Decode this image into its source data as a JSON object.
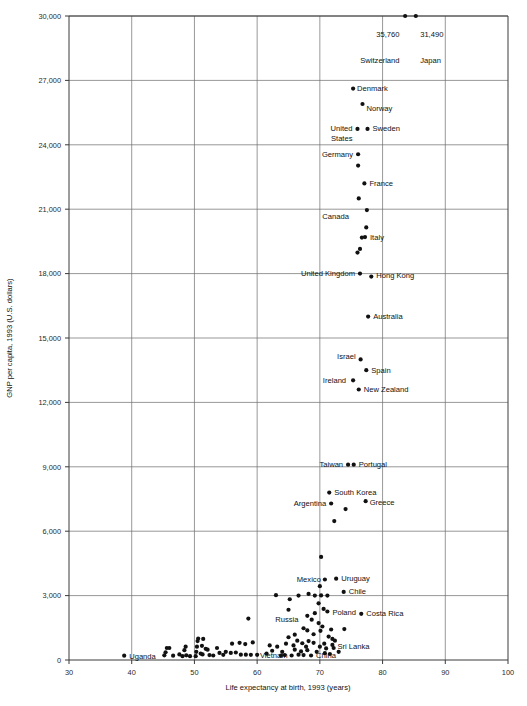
{
  "chart_data": {
    "type": "scatter",
    "title": "",
    "xlabel": "Life expectancy at birth, 1993 (years)",
    "ylabel": "GNP per capita, 1993 (U.S. dollars)",
    "xlim": [
      30,
      100
    ],
    "ylim": [
      0,
      30000
    ],
    "xticks": [
      30,
      40,
      50,
      60,
      70,
      80,
      90,
      100
    ],
    "xtick_labels": [
      "30",
      "40",
      "50",
      "60",
      "70",
      "80",
      "90",
      "100"
    ],
    "yticks": [
      0,
      3000,
      6000,
      9000,
      12000,
      15000,
      18000,
      21000,
      24000,
      27000,
      30000
    ],
    "ytick_labels": [
      "0",
      "3,000",
      "6,000",
      "9,000",
      "12,000",
      "15,000",
      "18,000",
      "21,000",
      "24,000",
      "27,000",
      "30,000"
    ],
    "grid": true,
    "legend": "none",
    "marker_color": "#111111",
    "grid_color": "#6b6b6b",
    "axis_color": "#3a3a3a",
    "annotations": [
      {
        "text": "35,760",
        "x": 83.5,
        "y": 29000,
        "anchor": "end",
        "dx": -5,
        "dy": 0
      },
      {
        "text": "Switzerland",
        "x": 83.5,
        "y": 27800,
        "anchor": "end",
        "dx": -5,
        "dy": 0
      },
      {
        "text": "31,490",
        "x": 85.2,
        "y": 29000,
        "anchor": "start",
        "dx": 5,
        "dy": 0
      },
      {
        "text": "Japan",
        "x": 85.2,
        "y": 27800,
        "anchor": "start",
        "dx": 5,
        "dy": 0
      }
    ],
    "labeled_points": [
      {
        "name": "Switzerland",
        "x": 83.6,
        "y": 30000,
        "label": "",
        "anchor": "end",
        "dx": 0,
        "dy": 0
      },
      {
        "name": "Japan",
        "x": 85.3,
        "y": 30000,
        "label": "",
        "anchor": "start",
        "dx": 0,
        "dy": 0
      },
      {
        "name": "Denmark",
        "x": 75.3,
        "y": 26620,
        "label": "Denmark",
        "anchor": "start",
        "dx": 4,
        "dy": 2.5
      },
      {
        "name": "Norway",
        "x": 76.8,
        "y": 25900,
        "label": "Norway",
        "anchor": "start",
        "dx": 4,
        "dy": 6.5
      },
      {
        "name": "United States",
        "x": 76.0,
        "y": 24740,
        "label": "United\nStates",
        "anchor": "end",
        "dx": -5,
        "dy": 2.5
      },
      {
        "name": "Sweden",
        "x": 77.6,
        "y": 24740,
        "label": "Sweden",
        "anchor": "start",
        "dx": 5,
        "dy": 2.5
      },
      {
        "name": "Germany",
        "x": 76.1,
        "y": 23560,
        "label": "Germany",
        "anchor": "end",
        "dx": -5,
        "dy": 2.5
      },
      {
        "name": "Germany2",
        "x": 76.1,
        "y": 23030,
        "label": "",
        "anchor": "start",
        "dx": 0,
        "dy": 0
      },
      {
        "name": "France",
        "x": 77.1,
        "y": 22200,
        "label": "France",
        "anchor": "start",
        "dx": 5,
        "dy": 2.5
      },
      {
        "name": "Austria",
        "x": 76.2,
        "y": 21500,
        "label": "",
        "anchor": "start",
        "dx": 0,
        "dy": 0
      },
      {
        "name": "Canada",
        "x": 77.5,
        "y": 20960,
        "label": "Canada",
        "anchor": "end",
        "dx": -18,
        "dy": 9
      },
      {
        "name": "Italy",
        "x": 77.4,
        "y": 20150,
        "label": "",
        "anchor": "start",
        "dx": 0,
        "dy": 0
      },
      {
        "name": "ItalyPt",
        "x": 77.2,
        "y": 19700,
        "label": "Italy",
        "anchor": "start",
        "dx": 5,
        "dy": 3
      },
      {
        "name": "Netherlands",
        "x": 76.7,
        "y": 19680,
        "label": "",
        "anchor": "start",
        "dx": 0,
        "dy": 0
      },
      {
        "name": "Belgium",
        "x": 76.4,
        "y": 19150,
        "label": "",
        "anchor": "start",
        "dx": 0,
        "dy": 0
      },
      {
        "name": "Finland",
        "x": 76.0,
        "y": 18980,
        "label": "",
        "anchor": "start",
        "dx": 0,
        "dy": 0
      },
      {
        "name": "United Kingdom",
        "x": 76.4,
        "y": 18000,
        "label": "United Kingdom",
        "anchor": "end",
        "dx": -5,
        "dy": 2.5
      },
      {
        "name": "Hong Kong",
        "x": 78.2,
        "y": 17860,
        "label": "Hong Kong",
        "anchor": "start",
        "dx": 5,
        "dy": 1
      },
      {
        "name": "Australia",
        "x": 77.7,
        "y": 16000,
        "label": "Australia",
        "anchor": "start",
        "dx": 5,
        "dy": 2.5
      },
      {
        "name": "Israel",
        "x": 76.5,
        "y": 14000,
        "label": "Israel",
        "anchor": "end",
        "dx": -5,
        "dy": 0
      },
      {
        "name": "Spain",
        "x": 77.4,
        "y": 13500,
        "label": "Spain",
        "anchor": "start",
        "dx": 5,
        "dy": 2.5
      },
      {
        "name": "Ireland",
        "x": 75.3,
        "y": 13030,
        "label": "Ireland",
        "anchor": "end",
        "dx": -7,
        "dy": 2.5
      },
      {
        "name": "New Zealand",
        "x": 76.2,
        "y": 12600,
        "label": "New Zealand",
        "anchor": "start",
        "dx": 5,
        "dy": 2.5
      },
      {
        "name": "Taiwan",
        "x": 74.5,
        "y": 9100,
        "label": "Taiwan",
        "anchor": "end",
        "dx": -5,
        "dy": 2.5
      },
      {
        "name": "Portugal",
        "x": 75.4,
        "y": 9100,
        "label": "Portugal",
        "anchor": "start",
        "dx": 5,
        "dy": 2.5
      },
      {
        "name": "South Korea",
        "x": 71.5,
        "y": 7800,
        "label": "South Korea",
        "anchor": "start",
        "dx": 5,
        "dy": 2.5
      },
      {
        "name": "Argentina",
        "x": 71.8,
        "y": 7290,
        "label": "Argentina",
        "anchor": "end",
        "dx": -5,
        "dy": 2.5
      },
      {
        "name": "Greece",
        "x": 77.3,
        "y": 7400,
        "label": "Greece",
        "anchor": "start",
        "dx": 4,
        "dy": 3.5
      },
      {
        "name": "unlabeled-mid1",
        "x": 74.1,
        "y": 7030,
        "label": "",
        "anchor": "start",
        "dx": 0,
        "dy": 0
      },
      {
        "name": "unlabeled-mid2",
        "x": 72.3,
        "y": 6470,
        "label": "",
        "anchor": "start",
        "dx": 0,
        "dy": 0
      },
      {
        "name": "unlabeled-mid3",
        "x": 70.2,
        "y": 4800,
        "label": "",
        "anchor": "start",
        "dx": 0,
        "dy": 0
      },
      {
        "name": "Mexico",
        "x": 70.8,
        "y": 3750,
        "label": "Mexico",
        "anchor": "end",
        "dx": -4,
        "dy": 2.5
      },
      {
        "name": "Uruguay",
        "x": 72.6,
        "y": 3790,
        "label": "Uruguay",
        "anchor": "start",
        "dx": 5,
        "dy": 2.5
      },
      {
        "name": "Chile",
        "x": 73.8,
        "y": 3170,
        "label": "Chile",
        "anchor": "start",
        "dx": 5,
        "dy": 2.5
      },
      {
        "name": "Russia",
        "x": 65.0,
        "y": 2340,
        "label": "Russia",
        "anchor": "end",
        "dx": 10,
        "dy": 12
      },
      {
        "name": "Poland",
        "x": 71.2,
        "y": 2260,
        "label": "Poland",
        "anchor": "start",
        "dx": 5,
        "dy": 4
      },
      {
        "name": "Costa Rica",
        "x": 76.6,
        "y": 2150,
        "label": "Costa Rica",
        "anchor": "start",
        "dx": 5,
        "dy": 2.5
      },
      {
        "name": "Sri Lanka",
        "x": 72.0,
        "y": 700,
        "label": "Sri Lanka",
        "anchor": "start",
        "dx": 5,
        "dy": 4
      },
      {
        "name": "China",
        "x": 68.6,
        "y": 210,
        "label": "China",
        "anchor": "start",
        "dx": 5,
        "dy": 3
      },
      {
        "name": "Vietnam",
        "x": 65.5,
        "y": 210,
        "label": "Vietnam",
        "anchor": "end",
        "dx": -4,
        "dy": 3
      },
      {
        "name": "Uganda",
        "x": 38.8,
        "y": 200,
        "label": "Uganda",
        "anchor": "start",
        "dx": 5,
        "dy": 3
      }
    ],
    "unlabeled_points": [
      {
        "x": 63.0,
        "y": 3020
      },
      {
        "x": 65.2,
        "y": 2830
      },
      {
        "x": 66.6,
        "y": 3000
      },
      {
        "x": 68.2,
        "y": 3080
      },
      {
        "x": 69.2,
        "y": 3000
      },
      {
        "x": 70.0,
        "y": 3440
      },
      {
        "x": 70.2,
        "y": 3010
      },
      {
        "x": 71.2,
        "y": 3000
      },
      {
        "x": 69.8,
        "y": 2640
      },
      {
        "x": 70.6,
        "y": 2380
      },
      {
        "x": 68.0,
        "y": 2060
      },
      {
        "x": 69.2,
        "y": 2180
      },
      {
        "x": 68.7,
        "y": 1880
      },
      {
        "x": 69.8,
        "y": 1720
      },
      {
        "x": 70.4,
        "y": 1560
      },
      {
        "x": 67.4,
        "y": 1480
      },
      {
        "x": 68.0,
        "y": 1380
      },
      {
        "x": 69.0,
        "y": 1200
      },
      {
        "x": 70.1,
        "y": 1360
      },
      {
        "x": 73.9,
        "y": 1440
      },
      {
        "x": 71.4,
        "y": 1090
      },
      {
        "x": 72.0,
        "y": 980
      },
      {
        "x": 66.4,
        "y": 900
      },
      {
        "x": 67.2,
        "y": 780
      },
      {
        "x": 68.2,
        "y": 880
      },
      {
        "x": 69.0,
        "y": 800
      },
      {
        "x": 70.0,
        "y": 620
      },
      {
        "x": 70.7,
        "y": 760
      },
      {
        "x": 71.0,
        "y": 540
      },
      {
        "x": 66.0,
        "y": 480
      },
      {
        "x": 67.0,
        "y": 400
      },
      {
        "x": 68.0,
        "y": 460
      },
      {
        "x": 69.5,
        "y": 380
      },
      {
        "x": 70.8,
        "y": 320
      },
      {
        "x": 71.6,
        "y": 280
      },
      {
        "x": 59.3,
        "y": 820
      },
      {
        "x": 58.6,
        "y": 1930
      },
      {
        "x": 61.5,
        "y": 300
      },
      {
        "x": 62.4,
        "y": 430
      },
      {
        "x": 63.2,
        "y": 620
      },
      {
        "x": 64.0,
        "y": 380
      },
      {
        "x": 64.6,
        "y": 760
      },
      {
        "x": 65.8,
        "y": 680
      },
      {
        "x": 63.8,
        "y": 200
      },
      {
        "x": 64.4,
        "y": 230
      },
      {
        "x": 66.6,
        "y": 250
      },
      {
        "x": 67.4,
        "y": 230
      },
      {
        "x": 60.0,
        "y": 240
      },
      {
        "x": 56.0,
        "y": 760
      },
      {
        "x": 57.2,
        "y": 800
      },
      {
        "x": 58.1,
        "y": 740
      },
      {
        "x": 55.0,
        "y": 380
      },
      {
        "x": 55.8,
        "y": 330
      },
      {
        "x": 56.6,
        "y": 350
      },
      {
        "x": 57.4,
        "y": 250
      },
      {
        "x": 58.2,
        "y": 250
      },
      {
        "x": 54.0,
        "y": 330
      },
      {
        "x": 53.0,
        "y": 210
      },
      {
        "x": 52.4,
        "y": 230
      },
      {
        "x": 51.8,
        "y": 520
      },
      {
        "x": 51.3,
        "y": 260
      },
      {
        "x": 52.1,
        "y": 480
      },
      {
        "x": 50.6,
        "y": 1000
      },
      {
        "x": 50.5,
        "y": 880
      },
      {
        "x": 50.4,
        "y": 620
      },
      {
        "x": 50.3,
        "y": 380
      },
      {
        "x": 50.2,
        "y": 180
      },
      {
        "x": 51.4,
        "y": 980
      },
      {
        "x": 51.2,
        "y": 660
      },
      {
        "x": 51.0,
        "y": 300
      },
      {
        "x": 49.3,
        "y": 180
      },
      {
        "x": 48.7,
        "y": 220
      },
      {
        "x": 48.1,
        "y": 180
      },
      {
        "x": 48.6,
        "y": 620
      },
      {
        "x": 48.4,
        "y": 460
      },
      {
        "x": 47.6,
        "y": 260
      },
      {
        "x": 46.6,
        "y": 200
      },
      {
        "x": 45.6,
        "y": 560
      },
      {
        "x": 45.4,
        "y": 360
      },
      {
        "x": 45.2,
        "y": 220
      },
      {
        "x": 46.0,
        "y": 560
      },
      {
        "x": 53.6,
        "y": 560
      },
      {
        "x": 54.6,
        "y": 240
      },
      {
        "x": 59.0,
        "y": 240
      },
      {
        "x": 62.0,
        "y": 680
      },
      {
        "x": 65.0,
        "y": 1060
      },
      {
        "x": 66.0,
        "y": 1180
      },
      {
        "x": 67.8,
        "y": 620
      },
      {
        "x": 71.8,
        "y": 1420
      },
      {
        "x": 72.4,
        "y": 900
      },
      {
        "x": 72.2,
        "y": 560
      },
      {
        "x": 73.0,
        "y": 380
      }
    ]
  }
}
